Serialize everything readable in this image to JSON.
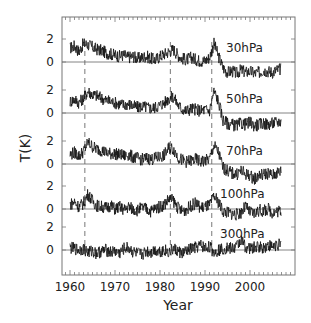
{
  "chart_data": {
    "type": "line",
    "title": "",
    "xlabel": "Year",
    "ylabel": "T(K)",
    "xlim": [
      1958.3,
      2010.0
    ],
    "x_ticks": [
      1960,
      1970,
      1980,
      1990,
      2000
    ],
    "x_tick_labels": [
      "1960",
      "1970",
      "1980",
      "1990",
      "2000"
    ],
    "y_tick_labels_per_panel": [
      "0",
      "2"
    ],
    "grid": false,
    "legend": null,
    "event_lines": {
      "style": "dashed",
      "x": [
        1963.3,
        1982.3,
        1991.5
      ]
    },
    "series": [
      {
        "name": "30hPa",
        "label": "30hPa",
        "baseline_y_px": 62,
        "px_per_K": 11.5,
        "label_x_px": 226,
        "label_y_px": 52,
        "x": [
          1960,
          1961,
          1962,
          1963,
          1964,
          1965,
          1966,
          1967,
          1968,
          1969,
          1970,
          1971,
          1972,
          1973,
          1974,
          1975,
          1976,
          1977,
          1978,
          1979,
          1980,
          1981,
          1982,
          1983,
          1984,
          1985,
          1986,
          1987,
          1988,
          1989,
          1990,
          1991,
          1992,
          1993,
          1994,
          1995,
          1996,
          1997,
          1998,
          1999,
          2000,
          2001,
          2002,
          2003,
          2004,
          2005,
          2006,
          2007
        ],
        "values": [
          1.2,
          1.4,
          0.9,
          1.6,
          1.5,
          1.3,
          1.1,
          1.0,
          0.8,
          0.7,
          0.6,
          0.5,
          0.6,
          0.4,
          0.5,
          0.3,
          0.4,
          0.5,
          0.3,
          0.2,
          0.5,
          0.7,
          0.9,
          1.1,
          0.6,
          0.3,
          0.2,
          0.4,
          0.2,
          0.1,
          0.1,
          0.4,
          1.6,
          0.5,
          -0.5,
          -0.9,
          -0.8,
          -1.0,
          -0.7,
          -0.9,
          -0.8,
          -1.0,
          -0.9,
          -0.7,
          -0.8,
          -0.9,
          -0.7,
          -0.6
        ]
      },
      {
        "name": "50hPa",
        "label": "50hPa",
        "baseline_y_px": 113,
        "px_per_K": 11.5,
        "label_x_px": 226,
        "label_y_px": 103,
        "x": [
          1960,
          1961,
          1962,
          1963,
          1964,
          1965,
          1966,
          1967,
          1968,
          1969,
          1970,
          1971,
          1972,
          1973,
          1974,
          1975,
          1976,
          1977,
          1978,
          1979,
          1980,
          1981,
          1982,
          1983,
          1984,
          1985,
          1986,
          1987,
          1988,
          1989,
          1990,
          1991,
          1992,
          1993,
          1994,
          1995,
          1996,
          1997,
          1998,
          1999,
          2000,
          2001,
          2002,
          2003,
          2004,
          2005,
          2006,
          2007
        ],
        "values": [
          1.0,
          1.2,
          0.9,
          1.3,
          1.9,
          1.6,
          1.5,
          1.3,
          1.1,
          1.0,
          0.9,
          0.8,
          0.7,
          0.8,
          0.6,
          0.5,
          0.6,
          0.5,
          0.4,
          0.5,
          0.7,
          0.9,
          1.3,
          1.4,
          0.7,
          0.3,
          0.2,
          0.4,
          0.3,
          0.2,
          0.3,
          0.2,
          1.9,
          1.0,
          -0.6,
          -0.9,
          -1.0,
          -1.1,
          -0.9,
          -1.0,
          -0.8,
          -1.1,
          -1.0,
          -0.9,
          -1.0,
          -0.9,
          -0.8,
          -0.7
        ]
      },
      {
        "name": "70hPa",
        "label": "70hPa",
        "baseline_y_px": 164,
        "px_per_K": 11.5,
        "label_x_px": 226,
        "label_y_px": 155,
        "x": [
          1960,
          1961,
          1962,
          1963,
          1964,
          1965,
          1966,
          1967,
          1968,
          1969,
          1970,
          1971,
          1972,
          1973,
          1974,
          1975,
          1976,
          1977,
          1978,
          1979,
          1980,
          1981,
          1982,
          1983,
          1984,
          1985,
          1986,
          1987,
          1988,
          1989,
          1990,
          1991,
          1992,
          1993,
          1994,
          1995,
          1996,
          1997,
          1998,
          1999,
          2000,
          2001,
          2002,
          2003,
          2004,
          2005,
          2006,
          2007
        ],
        "values": [
          0.8,
          1.0,
          0.7,
          1.1,
          1.9,
          1.5,
          1.3,
          1.2,
          1.0,
          0.9,
          0.9,
          0.8,
          0.7,
          0.8,
          0.6,
          0.5,
          0.4,
          0.5,
          0.4,
          0.5,
          0.6,
          0.8,
          1.4,
          1.3,
          0.6,
          0.3,
          0.2,
          0.3,
          0.4,
          0.2,
          0.3,
          0.4,
          1.6,
          1.0,
          -0.3,
          -0.6,
          -0.8,
          -0.9,
          -0.6,
          -0.9,
          -1.0,
          -1.3,
          -1.0,
          -0.9,
          -0.8,
          -1.0,
          -0.8,
          -0.6
        ]
      },
      {
        "name": "100hPa",
        "label": "100hPa",
        "baseline_y_px": 209,
        "px_per_K": 11.5,
        "label_x_px": 220,
        "label_y_px": 198,
        "x": [
          1960,
          1961,
          1962,
          1963,
          1964,
          1965,
          1966,
          1967,
          1968,
          1969,
          1970,
          1971,
          1972,
          1973,
          1974,
          1975,
          1976,
          1977,
          1978,
          1979,
          1980,
          1981,
          1982,
          1983,
          1984,
          1985,
          1986,
          1987,
          1988,
          1989,
          1990,
          1991,
          1992,
          1993,
          1994,
          1995,
          1996,
          1997,
          1998,
          1999,
          2000,
          2001,
          2002,
          2003,
          2004,
          2005,
          2006,
          2007
        ],
        "values": [
          0.4,
          0.6,
          0.2,
          0.5,
          1.3,
          0.7,
          0.3,
          0.2,
          0.1,
          0.3,
          0.0,
          0.2,
          -0.1,
          0.2,
          0.0,
          -0.1,
          0.1,
          0.0,
          -0.2,
          0.1,
          0.2,
          0.4,
          0.9,
          0.7,
          0.1,
          -0.2,
          0.0,
          0.3,
          0.5,
          0.1,
          0.2,
          0.3,
          1.1,
          0.6,
          -0.2,
          -0.3,
          -0.4,
          -0.5,
          -0.3,
          0.2,
          -0.3,
          -0.4,
          -0.1,
          -0.2,
          0.0,
          -0.3,
          -0.2,
          -0.1
        ]
      },
      {
        "name": "300hPa",
        "label": "300hPa",
        "baseline_y_px": 250,
        "px_per_K": 11.5,
        "label_x_px": 220,
        "label_y_px": 238,
        "x": [
          1960,
          1961,
          1962,
          1963,
          1964,
          1965,
          1966,
          1967,
          1968,
          1969,
          1970,
          1971,
          1972,
          1973,
          1974,
          1975,
          1976,
          1977,
          1978,
          1979,
          1980,
          1981,
          1982,
          1983,
          1984,
          1985,
          1986,
          1987,
          1988,
          1989,
          1990,
          1991,
          1992,
          1993,
          1994,
          1995,
          1996,
          1997,
          1998,
          1999,
          2000,
          2001,
          2002,
          2003,
          2004,
          2005,
          2006,
          2007
        ],
        "values": [
          0.2,
          0.1,
          0.0,
          0.1,
          -0.2,
          -0.1,
          -0.3,
          -0.1,
          0.0,
          -0.2,
          -0.1,
          -0.3,
          0.1,
          0.2,
          -0.2,
          -0.3,
          -0.4,
          -0.1,
          -0.2,
          0.0,
          -0.1,
          0.0,
          -0.2,
          0.1,
          -0.1,
          -0.3,
          -0.1,
          0.1,
          0.2,
          0.4,
          0.2,
          0.3,
          -0.2,
          0.0,
          0.1,
          0.2,
          0.1,
          0.3,
          0.9,
          0.3,
          0.1,
          0.2,
          0.3,
          0.2,
          0.4,
          0.3,
          0.5,
          0.4
        ]
      }
    ],
    "layout": {
      "plot_left_px": 62,
      "plot_right_px": 295,
      "plot_top_px": 17,
      "plot_bottom_px": 275,
      "x_px_per_year": 4.5,
      "x_origin_year": 1960,
      "x_origin_px": 70
    }
  }
}
